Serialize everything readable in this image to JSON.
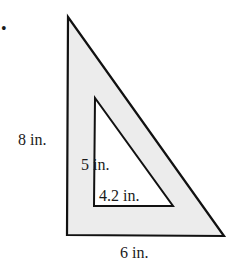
{
  "diagram": {
    "outer_triangle": {
      "height_label": "8 in.",
      "base_label": "6 in.",
      "fill": "#ececec",
      "stroke": "#111111"
    },
    "inner_triangle": {
      "height_label": "5 in.",
      "base_label": "4.2 in.",
      "fill": "#ffffff",
      "stroke": "#111111"
    },
    "bullet": "•"
  }
}
